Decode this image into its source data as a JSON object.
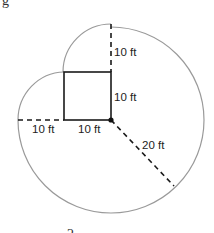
{
  "figure": {
    "top_left_fragment": "g",
    "bottom_fragment": "2",
    "labels": {
      "top_radius": "10 ft",
      "square_side_right": "10 ft",
      "left_radius": "10 ft",
      "square_side_bottom": "10 ft",
      "large_radius": "20 ft"
    },
    "geometry": {
      "square": {
        "x": 64,
        "y": 72,
        "size": 47
      },
      "pivot": {
        "x": 111,
        "y": 120
      },
      "large_circle": {
        "cx": 111,
        "cy": 120,
        "r": 93
      },
      "top_arc": {
        "cx": 111,
        "cy": 72,
        "r": 48
      },
      "left_arc": {
        "cx": 64,
        "cy": 120,
        "r": 46
      }
    },
    "colors": {
      "arc": "#9a9a9a",
      "line": "#1a1a1a",
      "text": "#222222"
    }
  }
}
